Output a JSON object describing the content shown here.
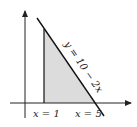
{
  "diagram": {
    "type": "shaded-region-plot",
    "line_label": "y = 10 − 2x",
    "left_bound_label": "x = 1",
    "right_bound_label": "x = 5",
    "colors": {
      "axis": "#222222",
      "line": "#111111",
      "shade": "#dcdcdc"
    }
  }
}
